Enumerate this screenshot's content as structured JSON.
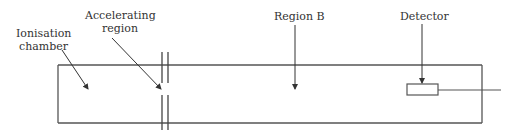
{
  "diagram": {
    "type": "mass-spectrometer",
    "labels": {
      "ionisation_line1": "Ionisation",
      "ionisation_line2": "chamber",
      "accelerating_line1": "Accelerating",
      "accelerating_line2": "region",
      "region_b": "Region B",
      "detector": "Detector"
    },
    "colors": {
      "stroke": "#555555",
      "text": "#333333"
    }
  }
}
